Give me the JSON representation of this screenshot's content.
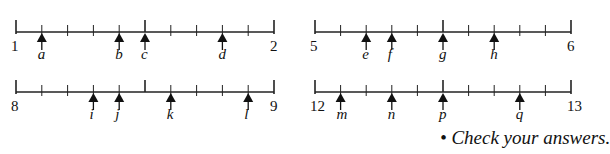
{
  "number_lines": [
    {
      "start": "1",
      "end": "2",
      "x0": 16,
      "x1": 274,
      "y": 32,
      "markers": [
        {
          "label": "a",
          "tick": 1
        },
        {
          "label": "b",
          "tick": 4
        },
        {
          "label": "c",
          "tick": 5
        },
        {
          "label": "d",
          "tick": 8
        }
      ]
    },
    {
      "start": "5",
      "end": "6",
      "x0": 315,
      "x1": 571,
      "y": 32,
      "markers": [
        {
          "label": "e",
          "tick": 2
        },
        {
          "label": "f",
          "tick": 3
        },
        {
          "label": "g",
          "tick": 5
        },
        {
          "label": "h",
          "tick": 7
        }
      ]
    },
    {
      "start": "8",
      "end": "9",
      "x0": 16,
      "x1": 274,
      "y": 92,
      "markers": [
        {
          "label": "i",
          "tick": 3
        },
        {
          "label": "j",
          "tick": 4
        },
        {
          "label": "k",
          "tick": 6
        },
        {
          "label": "l",
          "tick": 9
        }
      ]
    },
    {
      "start": "12",
      "end": "13",
      "x0": 315,
      "x1": 571,
      "y": 92,
      "markers": [
        {
          "label": "m",
          "tick": 1
        },
        {
          "label": "n",
          "tick": 3
        },
        {
          "label": "p",
          "tick": 5
        },
        {
          "label": "q",
          "tick": 8
        }
      ]
    }
  ],
  "divisions": 10,
  "footer": {
    "check": "• Check your answers."
  }
}
